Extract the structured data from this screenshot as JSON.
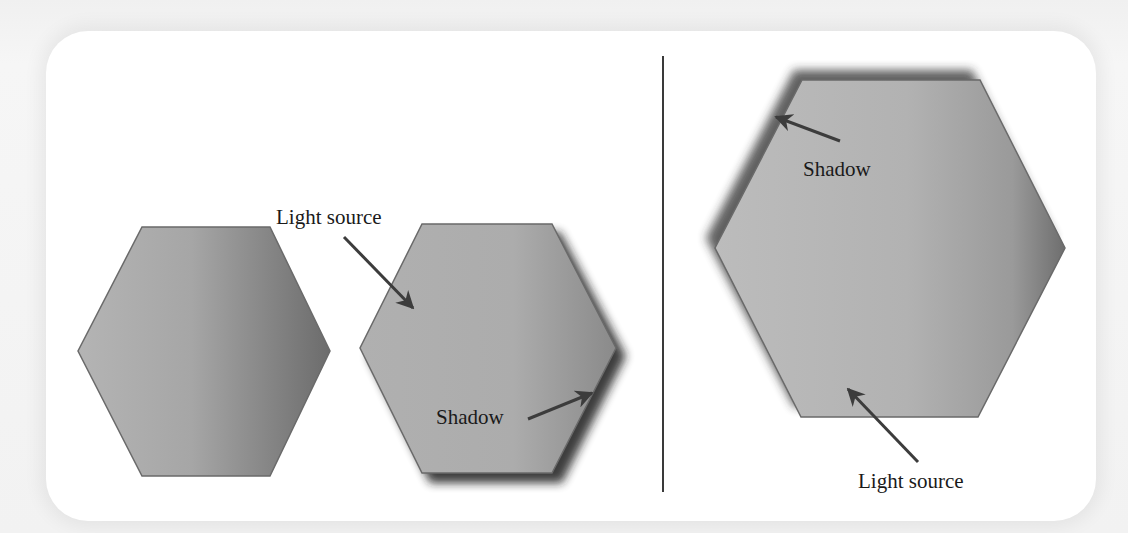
{
  "figure": {
    "left_panel": {
      "plain_hexagon": {
        "shadow": "none"
      },
      "shadowed_hexagon": {
        "shadow": "bottom-right",
        "labels": {
          "light_source": "Light source",
          "shadow": "Shadow"
        }
      }
    },
    "right_panel": {
      "shadowed_hexagon": {
        "shadow": "top-left",
        "labels": {
          "shadow": "Shadow",
          "light_source": "Light source"
        }
      }
    },
    "colors": {
      "card_background": "#ffffff",
      "page_background": "#f2f2f2",
      "hexagon_light": "#b8b8b8",
      "hexagon_dark": "#6e6e6e",
      "hexagon_edge": "#6a6a6a",
      "arrow": "#3c3c3c",
      "divider": "#3a3a3a",
      "text": "#1a1a1a"
    }
  }
}
